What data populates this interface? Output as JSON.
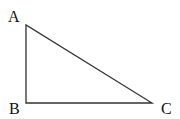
{
  "diagram": {
    "type": "right-triangle",
    "vertices": [
      {
        "label": "A",
        "x": 26,
        "y": 25,
        "label_x": 8,
        "label_y": 22
      },
      {
        "label": "B",
        "x": 26,
        "y": 103,
        "label_x": 9,
        "label_y": 114
      },
      {
        "label": "C",
        "x": 152,
        "y": 103,
        "label_x": 161,
        "label_y": 114
      }
    ],
    "edges": [
      [
        "A",
        "B"
      ],
      [
        "B",
        "C"
      ],
      [
        "C",
        "A"
      ]
    ],
    "stroke_color": "#333333"
  }
}
